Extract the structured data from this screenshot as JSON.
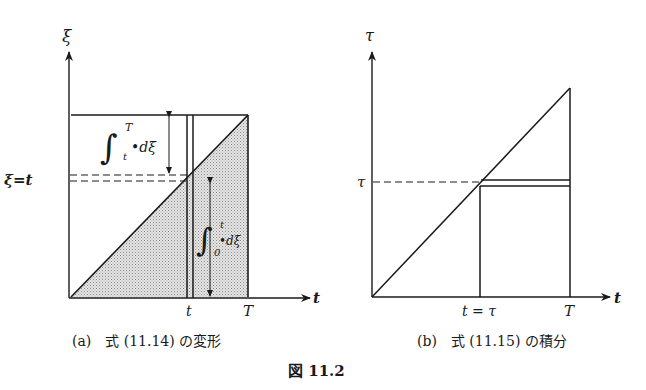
{
  "figure": {
    "caption": "図 11.2",
    "panels": [
      {
        "id": "a",
        "caption": "(a)　式 (11.14) の変形",
        "y_axis_label": "ξ",
        "x_axis_label": "t",
        "y_level_label": "ξ=t",
        "x_tick_labels": [
          "t",
          "T"
        ],
        "upper_integral": {
          "symbol": "∫",
          "upper": "T",
          "lower": "t",
          "integrand": "•dξ"
        },
        "lower_integral": {
          "symbol": "∫",
          "upper": "t",
          "lower": "0",
          "integrand": "•dξ"
        },
        "shaded_region": "triangle below diagonal ξ = t, from 0 to T"
      },
      {
        "id": "b",
        "caption": "(b)　式 (11.15) の積分",
        "y_axis_label": "τ",
        "x_axis_label": "t",
        "y_level_label": "τ",
        "x_tick_labels": [
          "t = τ",
          "T"
        ]
      }
    ]
  }
}
